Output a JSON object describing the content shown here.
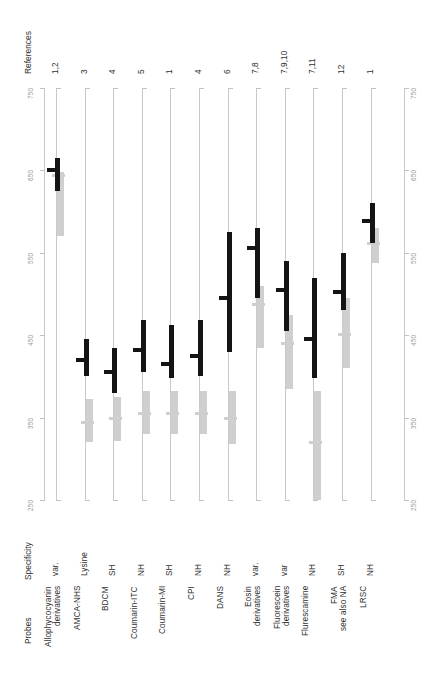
{
  "figure": {
    "headers": {
      "references": "References",
      "specificity": "Specificity",
      "probes": "Probes"
    },
    "axis": {
      "ticks": [
        750,
        650,
        550,
        450,
        350,
        250
      ],
      "tick_labels": [
        "750",
        "650",
        "550",
        "450",
        "350",
        "250"
      ],
      "min": 250,
      "max": 750,
      "label_left_repeat": true,
      "label_right_repeat": true
    },
    "colors": {
      "black_bar": "#141414",
      "gray_bar": "#cfcfcf",
      "axis": "#c9c9c9",
      "tick_text": "#9a9a9a",
      "label_text": "#2f2f2f",
      "background": "#ffffff"
    },
    "rows": [
      {
        "probe": "Allophycocyanin\nderivatives",
        "specificity": "var.",
        "references": "1,2",
        "excitation": {
          "low": 625,
          "high": 665,
          "marker": 650
        },
        "emission": {
          "low": 570,
          "high": 648,
          "marker": 645
        }
      },
      {
        "probe": "AMCA-NHS",
        "specificity": "Lysine",
        "references": "3",
        "excitation": {
          "low": 400,
          "high": 445,
          "marker": 420
        },
        "emission": {
          "low": 320,
          "high": 372,
          "marker": 345
        }
      },
      {
        "probe": "BDCM",
        "specificity": "SH",
        "references": "4",
        "excitation": {
          "low": 380,
          "high": 435,
          "marker": 405
        },
        "emission": {
          "low": 322,
          "high": 375,
          "marker": 350
        }
      },
      {
        "probe": "Coumarin-ITC",
        "specificity": "NH",
        "references": "5",
        "excitation": {
          "low": 405,
          "high": 468,
          "marker": 432
        },
        "emission": {
          "low": 330,
          "high": 382,
          "marker": 355
        }
      },
      {
        "probe": "Coumarin-MI",
        "specificity": "SH",
        "references": "1",
        "excitation": {
          "low": 398,
          "high": 462,
          "marker": 415
        },
        "emission": {
          "low": 330,
          "high": 382,
          "marker": 356
        }
      },
      {
        "probe": "CPI",
        "specificity": "NH",
        "references": "4",
        "excitation": {
          "low": 400,
          "high": 468,
          "marker": 425
        },
        "emission": {
          "low": 330,
          "high": 382,
          "marker": 356
        }
      },
      {
        "probe": "DANS",
        "specificity": "NH",
        "references": "6",
        "excitation": {
          "low": 430,
          "high": 575,
          "marker": 495
        },
        "emission": {
          "low": 318,
          "high": 382,
          "marker": 350
        }
      },
      {
        "probe": "Eosin\nderivatives",
        "specificity": "var.",
        "references": "7,8",
        "excitation": {
          "low": 495,
          "high": 580,
          "marker": 556
        },
        "emission": {
          "low": 435,
          "high": 510,
          "marker": 488
        }
      },
      {
        "probe": "Fluorescein\nderivatives",
        "specificity": "var",
        "references": "7,9,10",
        "excitation": {
          "low": 455,
          "high": 540,
          "marker": 505
        },
        "emission": {
          "low": 385,
          "high": 475,
          "marker": 440
        }
      },
      {
        "probe": "Flurescamine",
        "specificity": "NH",
        "references": "7,11",
        "excitation": {
          "low": 398,
          "high": 520,
          "marker": 445
        },
        "emission": {
          "low": 250,
          "high": 382,
          "marker": 320
        }
      },
      {
        "probe": "FMA\nsee also NA",
        "specificity": "SH",
        "references": "12",
        "excitation": {
          "low": 480,
          "high": 550,
          "marker": 502
        },
        "emission": {
          "low": 410,
          "high": 495,
          "marker": 452
        }
      },
      {
        "probe": "LRSC",
        "specificity": "NH",
        "references": "1",
        "excitation": {
          "low": 562,
          "high": 610,
          "marker": 588
        },
        "emission": {
          "low": 538,
          "high": 580,
          "marker": 562
        }
      }
    ]
  },
  "chart_data": {
    "type": "bar",
    "title": "",
    "xlabel": "Probes",
    "ylabel": "Wavelength (nm)",
    "ylim": [
      250,
      750
    ],
    "grid": false,
    "legend": [
      "excitation range (black)",
      "emission range (grey)"
    ],
    "orientation": "vertical-ranges-per-category",
    "categories": [
      "Allophycocyanin derivatives",
      "AMCA-NHS",
      "BDCM",
      "Coumarin-ITC",
      "Coumarin-MI",
      "CPI",
      "DANS",
      "Eosin derivatives",
      "Fluorescein derivatives",
      "Flurescamine",
      "FMA see also NA",
      "LRSC"
    ],
    "series": [
      {
        "name": "excitation-range-low",
        "values": [
          625,
          400,
          380,
          405,
          398,
          400,
          430,
          495,
          455,
          398,
          480,
          562
        ]
      },
      {
        "name": "excitation-range-high",
        "values": [
          665,
          445,
          435,
          468,
          462,
          468,
          575,
          580,
          540,
          520,
          550,
          610
        ]
      },
      {
        "name": "excitation-marker",
        "values": [
          650,
          420,
          405,
          432,
          415,
          425,
          495,
          556,
          505,
          445,
          502,
          588
        ]
      },
      {
        "name": "emission-range-low",
        "values": [
          570,
          320,
          322,
          330,
          330,
          330,
          318,
          435,
          385,
          250,
          410,
          538
        ]
      },
      {
        "name": "emission-range-high",
        "values": [
          648,
          372,
          375,
          382,
          382,
          382,
          382,
          510,
          475,
          382,
          495,
          580
        ]
      },
      {
        "name": "emission-marker",
        "values": [
          645,
          345,
          350,
          355,
          356,
          356,
          350,
          488,
          440,
          320,
          452,
          562
        ]
      }
    ],
    "specificity": [
      "var.",
      "Lysine",
      "SH",
      "NH",
      "SH",
      "NH",
      "NH",
      "var.",
      "var",
      "NH",
      "SH",
      "NH"
    ],
    "references": [
      "1,2",
      "3",
      "4",
      "5",
      "1",
      "4",
      "6",
      "7,8",
      "7,9,10",
      "7,11",
      "12",
      "1"
    ]
  }
}
